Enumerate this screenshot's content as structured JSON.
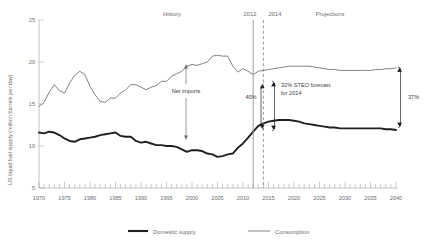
{
  "chart_data": {
    "type": "line",
    "title": "",
    "xlabel": "",
    "ylabel": "US liquid fuel supply (million barrels per day)",
    "xlim": [
      1970,
      2040
    ],
    "ylim": [
      5,
      25
    ],
    "yticks": [
      "5",
      "10",
      "15",
      "20",
      "25"
    ],
    "ytick_values": [
      5,
      10,
      15,
      20,
      25
    ],
    "xticks": [
      "1970",
      "1975",
      "1980",
      "1985",
      "1990",
      "1995",
      "2000",
      "2005",
      "2010",
      "2015",
      "2020",
      "2025",
      "2030",
      "2035",
      "2040"
    ],
    "xtick_values": [
      1970,
      1975,
      1980,
      1985,
      1990,
      1995,
      2000,
      2005,
      2010,
      2015,
      2020,
      2025,
      2030,
      2035,
      2040
    ],
    "minor_tick_interval": 1,
    "grid": false,
    "legend_position": "bottom",
    "x": [
      1970,
      1971,
      1972,
      1973,
      1974,
      1975,
      1976,
      1977,
      1978,
      1979,
      1980,
      1981,
      1982,
      1983,
      1984,
      1985,
      1986,
      1987,
      1988,
      1989,
      1990,
      1991,
      1992,
      1993,
      1994,
      1995,
      1996,
      1997,
      1998,
      1999,
      2000,
      2001,
      2002,
      2003,
      2004,
      2005,
      2006,
      2007,
      2008,
      2009,
      2010,
      2011,
      2012,
      2013,
      2014,
      2015,
      2016,
      2017,
      2018,
      2019,
      2020,
      2021,
      2022,
      2023,
      2024,
      2025,
      2026,
      2027,
      2028,
      2029,
      2030,
      2031,
      2032,
      2033,
      2034,
      2035,
      2036,
      2037,
      2038,
      2039,
      2040
    ],
    "series": [
      {
        "name": "Consumption",
        "color": "#808285",
        "style": "thin",
        "values": [
          14.7,
          15.2,
          16.4,
          17.3,
          16.6,
          16.3,
          17.5,
          18.4,
          18.9,
          18.5,
          17.1,
          16.1,
          15.3,
          15.2,
          15.7,
          15.7,
          16.3,
          16.7,
          17.3,
          17.3,
          17.0,
          16.7,
          17.0,
          17.2,
          17.7,
          17.7,
          18.3,
          18.6,
          18.9,
          19.5,
          19.7,
          19.6,
          19.8,
          20.0,
          20.7,
          20.8,
          20.7,
          20.7,
          19.5,
          18.8,
          19.2,
          18.9,
          18.5,
          18.9,
          19.0,
          19.1,
          19.2,
          19.3,
          19.4,
          19.5,
          19.5,
          19.5,
          19.5,
          19.5,
          19.4,
          19.3,
          19.2,
          19.1,
          19.1,
          19.0,
          19.0,
          19.0,
          19.0,
          19.0,
          19.0,
          19.0,
          19.1,
          19.1,
          19.2,
          19.2,
          19.3
        ]
      },
      {
        "name": "Domestic supply",
        "color": "#231f20",
        "style": "thick",
        "values": [
          11.6,
          11.5,
          11.7,
          11.6,
          11.3,
          10.9,
          10.6,
          10.5,
          10.8,
          10.9,
          11.0,
          11.1,
          11.3,
          11.4,
          11.5,
          11.6,
          11.2,
          11.1,
          11.1,
          10.6,
          10.4,
          10.5,
          10.3,
          10.1,
          10.1,
          10.0,
          10.0,
          9.9,
          9.6,
          9.3,
          9.5,
          9.5,
          9.4,
          9.1,
          9.0,
          8.7,
          8.8,
          9.0,
          9.1,
          9.8,
          10.3,
          11.0,
          11.7,
          12.4,
          12.7,
          12.9,
          13.0,
          13.1,
          13.1,
          13.1,
          13.0,
          12.9,
          12.7,
          12.6,
          12.5,
          12.4,
          12.3,
          12.2,
          12.2,
          12.1,
          12.1,
          12.1,
          12.1,
          12.1,
          12.1,
          12.1,
          12.1,
          12.1,
          12.0,
          12.0,
          11.9
        ]
      }
    ],
    "annotations": [
      {
        "name": "history-label",
        "text": "History",
        "x": 1992,
        "y": 24.4
      },
      {
        "name": "projections-label",
        "text": "Projections",
        "x": 2026,
        "y": 24.4
      },
      {
        "name": "year-2012-label",
        "text": "2012",
        "x": 2012,
        "y": 24.4
      },
      {
        "name": "year-2014-label",
        "text": "2014",
        "x": 2014,
        "y": 24.4
      },
      {
        "name": "net-imports-label",
        "text": "Net imports",
        "x": 1999,
        "y": 14.3
      },
      {
        "name": "gap-2012-label",
        "text": "40%",
        "x": 2009,
        "y": 14.0
      },
      {
        "name": "steo-forecast-label",
        "text": "32% STEO forecast\nfor 2014",
        "x": 2016,
        "y": 15.6
      },
      {
        "name": "gap-2040-label",
        "text": "37%",
        "x": 2042,
        "y": 15.3
      }
    ],
    "markers": [
      {
        "name": "vline-2012",
        "x": 2012,
        "style": "solid"
      },
      {
        "name": "vline-2014",
        "x": 2014,
        "style": "dashed"
      }
    ]
  },
  "legend": {
    "items": [
      {
        "label": "Domestic supply",
        "color": "#231f20",
        "weight": "thick"
      },
      {
        "label": "Consumption",
        "color": "#808285",
        "weight": "thin"
      }
    ]
  },
  "annotation_text": {
    "history": "History",
    "projections": "Projections",
    "year_2012": "2012",
    "year_2014": "2014",
    "net_imports": "Net imports",
    "pct_2012": "40%",
    "steo_line1": "32% STEO forecast",
    "steo_line2": "for 2014",
    "pct_2040": "37%"
  },
  "axis": {
    "y_title": "US liquid fuel supply (million barrels per day)",
    "y_labels": [
      "25",
      "20",
      "15",
      "10",
      "5"
    ],
    "x_labels": [
      "1970",
      "1975",
      "1980",
      "1985",
      "1990",
      "1995",
      "2000",
      "2005",
      "2010",
      "2015",
      "2020",
      "2025",
      "2030",
      "2035",
      "2040"
    ]
  },
  "colors": {
    "domestic": "#231f20",
    "consumption": "#808285",
    "axis": "#a7a9ac",
    "text": "#6d6e71",
    "background": "#ffffff"
  }
}
